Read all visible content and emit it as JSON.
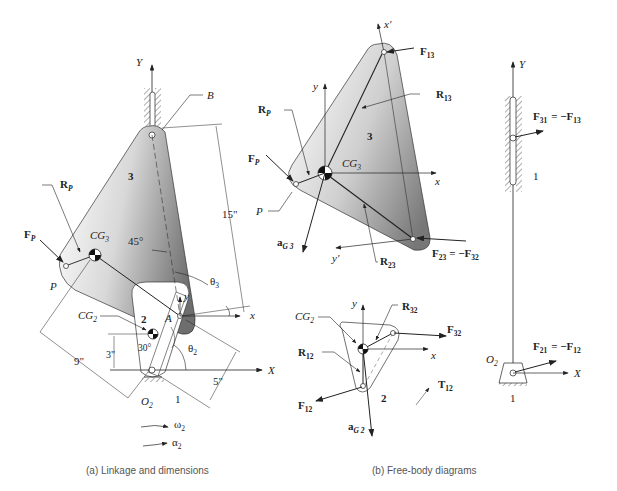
{
  "captions": {
    "a": "(a)  Linkage and dimensions",
    "b": "(b)  Free-body diagrams"
  },
  "panel_a": {
    "axis_Y": "Y",
    "axis_X": "X",
    "axis_x": "x",
    "axis_y": "y",
    "point_B": "B",
    "point_A": "A",
    "point_P": "P",
    "link3": "3",
    "link2": "2",
    "ground": "1",
    "pivot": "O",
    "pivot_sub": "2",
    "cg3": "CG",
    "cg3_sub": "3",
    "cg2": "CG",
    "cg2_sub": "2",
    "Rp": "R",
    "Rp_sub": "P",
    "Fp": "F",
    "Fp_sub": "P",
    "angle_45": "45°",
    "angle_30": "30°",
    "theta3": "θ",
    "theta3_sub": "3",
    "theta2": "θ",
    "theta2_sub": "2",
    "dim_15": "15\"",
    "dim_9": "9\"",
    "dim_3": "3\"",
    "dim_5": "5\"",
    "omega": "ω",
    "omega_sub": "2",
    "alpha": "α",
    "alpha_sub": "2"
  },
  "panel_b3": {
    "link": "3",
    "x_prime": "x'",
    "y_prime": "y'",
    "x": "x",
    "y": "y",
    "F13": "F",
    "F13_sub": "13",
    "R13": "R",
    "R13_sub": "13",
    "Rp": "R",
    "Rp_sub": "P",
    "Fp": "F",
    "Fp_sub": "P",
    "P": "P",
    "cg": "CG",
    "cg_sub": "3",
    "aG": "a",
    "aG_sub": "G 3",
    "F23": "F",
    "F23_sub": "23",
    "F23_eq": "= −F",
    "F23_eq_sub": "32",
    "R23": "R",
    "R23_sub": "23"
  },
  "panel_b2": {
    "link": "2",
    "x": "x",
    "y": "y",
    "cg": "CG",
    "cg_sub": "2",
    "R32": "R",
    "R32_sub": "32",
    "F32": "F",
    "F32_sub": "32",
    "R12": "R",
    "R12_sub": "12",
    "F12": "F",
    "F12_sub": "12",
    "T12": "T",
    "T12_sub": "12",
    "aG": "a",
    "aG_sub": "G 2"
  },
  "panel_b1": {
    "Y": "Y",
    "X": "X",
    "ground_top": "1",
    "ground_bot": "1",
    "pivot": "O",
    "pivot_sub": "2",
    "F31": "F",
    "F31_sub": "31",
    "F31_eq": "= −F",
    "F31_eq_sub": "13",
    "F21": "F",
    "F21_sub": "21",
    "F21_eq": "= −F",
    "F21_eq_sub": "12"
  },
  "colors": {
    "link_light": "#f2f2f2",
    "link_dark": "#8a8a8a",
    "line": "#222222"
  }
}
